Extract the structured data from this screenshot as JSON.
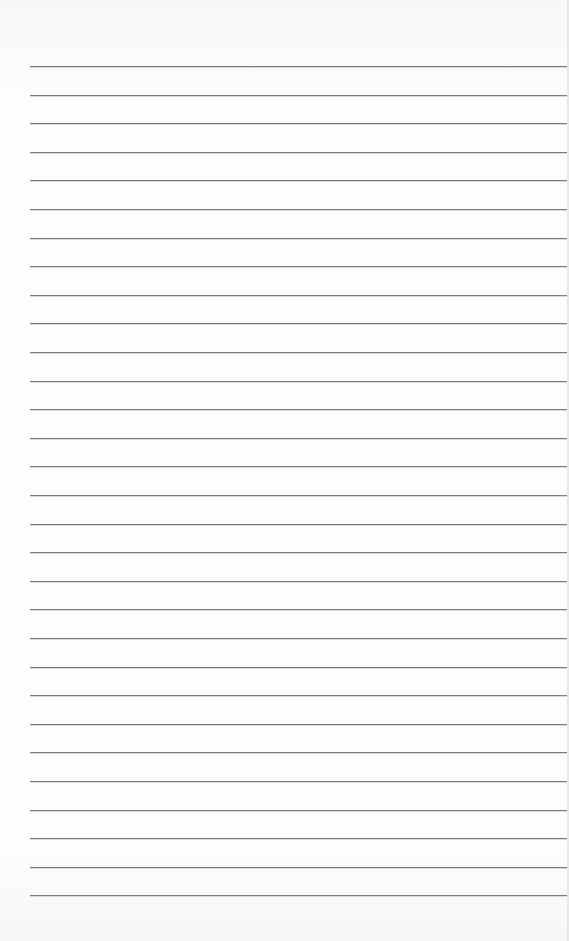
{
  "page": {
    "type": "lined-paper",
    "background_color": "#fbfbfb",
    "rule_color": "#7a7a7a",
    "rule_count": 30,
    "first_rule_y": 66,
    "rule_spacing": 28.6,
    "rule_left_x": 30
  }
}
